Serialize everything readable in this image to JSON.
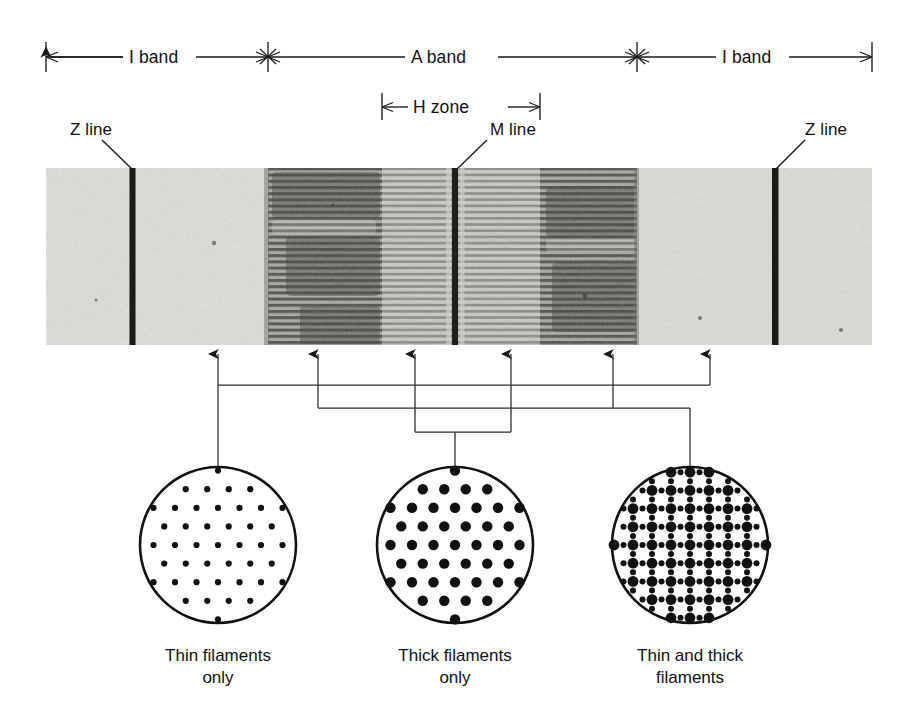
{
  "figure": {
    "title_absent": true
  },
  "band_scale": {
    "left_i_band": {
      "label": "I band",
      "x_start": 46,
      "x_end": 268
    },
    "a_band": {
      "label": "A band",
      "x_start": 268,
      "x_end": 637
    },
    "right_i_band": {
      "label": "I band",
      "x_start": 637,
      "x_end": 872
    },
    "h_zone": {
      "label": "H zone",
      "x_start": 382,
      "x_end": 540
    }
  },
  "pointer_labels": [
    {
      "name": "z-line-left",
      "text": "Z line",
      "label_x": 70,
      "label_y": 128,
      "tip_x": 133,
      "tip_y": 170
    },
    {
      "name": "m-line",
      "text": "M line",
      "label_x": 490,
      "label_y": 128,
      "tip_x": 455,
      "tip_y": 170
    },
    {
      "name": "z-line-right",
      "text": "Z line",
      "label_x": 805,
      "label_y": 128,
      "tip_x": 775,
      "tip_y": 170
    }
  ],
  "micrograph": {
    "x": 46,
    "y": 168,
    "width": 826,
    "height": 177,
    "z_lines_x": [
      133,
      775
    ],
    "m_line_x": 455,
    "a_band_x": [
      268,
      637
    ],
    "h_zone_x": [
      382,
      540
    ]
  },
  "connectors": {
    "arrow_xs": [
      218,
      318,
      415,
      511,
      613,
      710
    ],
    "bus_y": [
      385,
      408,
      432
    ],
    "arrow_top_y": 352,
    "circle_top_y": 468
  },
  "cross_sections": [
    {
      "name": "thin-filaments-only",
      "cx": 218,
      "cy": 545,
      "r": 78,
      "caption_line1": "Thin filaments",
      "caption_line2": "only",
      "lattice": "hexagonal",
      "dot_kinds": [
        "thin"
      ],
      "thin_radius": 3.1,
      "thick_radius": 0
    },
    {
      "name": "thick-filaments-only",
      "cx": 455,
      "cy": 545,
      "r": 78,
      "caption_line1": "Thick filaments",
      "caption_line2": "only",
      "lattice": "hexagonal",
      "dot_kinds": [
        "thick"
      ],
      "thin_radius": 0,
      "thick_radius": 5.2
    },
    {
      "name": "thin-and-thick-filaments",
      "cx": 690,
      "cy": 545,
      "r": 78,
      "caption_line1": "Thin and thick",
      "caption_line2": "filaments",
      "lattice": "interleaved",
      "dot_kinds": [
        "thick",
        "thin"
      ],
      "thin_radius": 3.0,
      "thick_radius": 5.4
    }
  ],
  "colors": {
    "ink": "#111111",
    "line": "#1a1a1a",
    "paper": "#ffffff",
    "micrograph_light": "#dcdcd8",
    "micrograph_mid": "#9a9a96",
    "micrograph_dark": "#2a2a28"
  }
}
